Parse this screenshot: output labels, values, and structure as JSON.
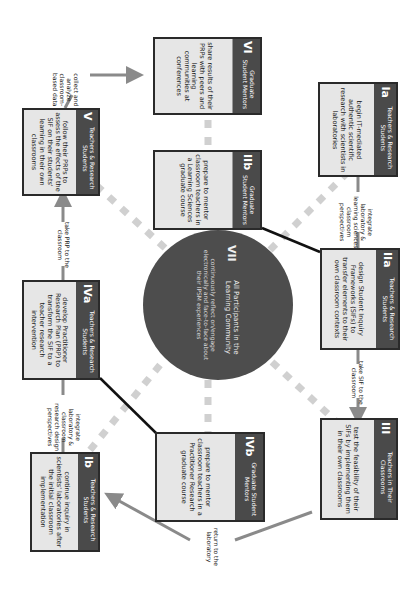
{
  "diagram": {
    "orientation": "rotated 90 degrees clockwise",
    "center": {
      "number": "VII",
      "title": "All Participants in the Learning Community",
      "body": "continuously reflect on/engage electronically and face-to-face about their IPSM experiences"
    },
    "boxes": {
      "ia": {
        "number": "Ia",
        "role": "Teachers & Research Students",
        "body": "begin IT-mediated authentic scientific research with scientists in laboratories"
      },
      "ib": {
        "number": "Ib",
        "role": "Teachers & Research Students",
        "body": "continue inquiry in scientists' laboratories after the initial classroom implementation"
      },
      "iia": {
        "number": "IIa",
        "role": "Teachers & Research Students",
        "body": "design Student Inquiry Frameworks (SIFs) to transfer elements to their own classroom contexts"
      },
      "iib": {
        "number": "IIb",
        "role": "Graduate Student Mentors",
        "body": "prepare to mentor classroom teachers in a Learning Sciences graduate course"
      },
      "iii": {
        "number": "III",
        "role": "Teachers in Their Classrooms",
        "body": "test the feasibility of their SIFs by implementing them in their own classrooms"
      },
      "iva": {
        "number": "IVa",
        "role": "Teachers & Research Students",
        "body": "develop Practitioner Research Plan (PRP) to transform the SIF to a teacher research intervention"
      },
      "ivb": {
        "number": "IVb",
        "role": "Graduate Student Mentors",
        "body": "prepare to mentor classroom teachers in a Practitioner Research graduate course"
      },
      "v": {
        "number": "V",
        "role": "Teachers & Research Students",
        "body": "follow their PRPs to assess the effects of the SIF on their students' learning in their own classrooms"
      },
      "vi": {
        "number": "VI",
        "role": "Graduate Student Mentors",
        "body": "share results of their PRPs with peers and learning communities at conferences"
      }
    },
    "connector_labels": {
      "ia_to_iia": "integrate laboratory & learning sciences classroom perspectives",
      "iia_to_iii": "take SIF to the classroom",
      "iii_to_ib": "return to the laboratory",
      "ib_to_iva": "integrate laboratory & classroom research design perspectives",
      "iva_to_v": "take PRP to the classroom",
      "v_to_vi": "collect and analyze classroom-based data"
    },
    "colors": {
      "box_fill": "#e6e6e6",
      "header_fill": "#4a4a4a",
      "border": "#2a2a2a",
      "circle_fill": "#4d4d4d",
      "arrow": "#8a8a8a",
      "dash": "#cfcfcf"
    }
  }
}
